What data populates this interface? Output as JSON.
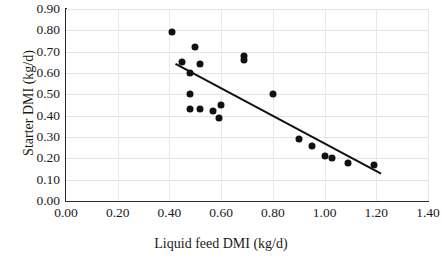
{
  "chart_data": {
    "type": "scatter",
    "title": "",
    "xlabel": "Liquid feed DMI (kg/d)",
    "ylabel": "Starter DMI (kg/d)",
    "xlim": [
      0.0,
      1.4
    ],
    "ylim": [
      0.0,
      0.9
    ],
    "xtick_step": 0.2,
    "ytick_step": 0.1,
    "xticks": [
      "0.00",
      "0.20",
      "0.40",
      "0.60",
      "0.80",
      "1.00",
      "1.20",
      "1.40"
    ],
    "yticks": [
      "0.00",
      "0.10",
      "0.20",
      "0.30",
      "0.40",
      "0.50",
      "0.60",
      "0.70",
      "0.80",
      "0.90"
    ],
    "grid": true,
    "grid_axis": "both",
    "legend": "none",
    "marker": "filled-circle",
    "marker_color": "#111111",
    "series": [
      {
        "name": "Starter DMI vs Liquid feed DMI",
        "points": [
          [
            0.41,
            0.79
          ],
          [
            0.5,
            0.72
          ],
          [
            0.45,
            0.65
          ],
          [
            0.52,
            0.64
          ],
          [
            0.48,
            0.6
          ],
          [
            0.69,
            0.68
          ],
          [
            0.69,
            0.66
          ],
          [
            0.48,
            0.5
          ],
          [
            0.8,
            0.5
          ],
          [
            0.48,
            0.43
          ],
          [
            0.52,
            0.43
          ],
          [
            0.57,
            0.42
          ],
          [
            0.6,
            0.45
          ],
          [
            0.59,
            0.39
          ],
          [
            0.9,
            0.29
          ],
          [
            0.95,
            0.26
          ],
          [
            1.0,
            0.21
          ],
          [
            1.03,
            0.2
          ],
          [
            1.09,
            0.18
          ],
          [
            1.19,
            0.17
          ]
        ]
      }
    ],
    "trendline": {
      "type": "linear-fit",
      "color": "#111111",
      "x_start": 0.425,
      "y_start": 0.645,
      "x_end": 1.22,
      "y_end": 0.13
    }
  }
}
